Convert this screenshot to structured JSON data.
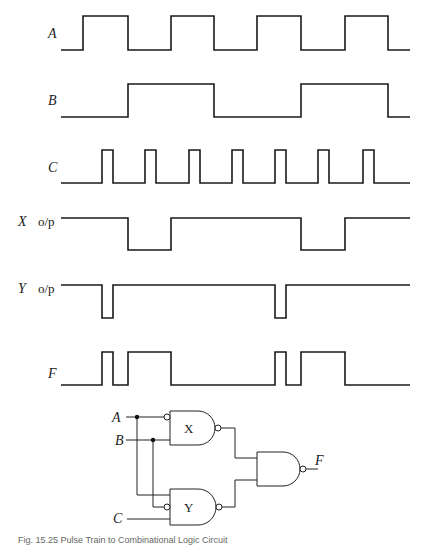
{
  "figure": {
    "caption": "Fig. 15.25  Pulse Train to Combinational Logic Circuit"
  },
  "waveforms": [
    {
      "name": "A",
      "suffix": "",
      "label_y": 33
    },
    {
      "name": "B",
      "suffix": "",
      "label_y": 100
    },
    {
      "name": "C",
      "suffix": "",
      "label_y": 167
    },
    {
      "name": "X",
      "suffix": "o/p",
      "label_y": 221
    },
    {
      "name": "Y",
      "suffix": "o/p",
      "label_y": 288
    },
    {
      "name": "F",
      "suffix": "",
      "label_y": 373
    }
  ],
  "timing": {
    "A": [
      [
        61,
        0
      ],
      [
        83,
        1
      ],
      [
        128,
        0
      ],
      [
        171,
        1
      ],
      [
        214,
        0
      ],
      [
        257,
        1
      ],
      [
        301,
        0
      ],
      [
        345,
        1
      ],
      [
        388,
        0
      ],
      [
        410,
        0
      ]
    ],
    "B": [
      [
        61,
        0
      ],
      [
        128,
        1
      ],
      [
        214,
        0
      ],
      [
        301,
        1
      ],
      [
        388,
        0
      ],
      [
        410,
        0
      ]
    ],
    "C": [
      [
        61,
        0
      ],
      [
        102,
        1
      ],
      [
        113,
        0
      ],
      [
        145,
        1
      ],
      [
        156,
        0
      ],
      [
        189,
        1
      ],
      [
        200,
        0
      ],
      [
        232,
        1
      ],
      [
        243,
        0
      ],
      [
        275,
        1
      ],
      [
        286,
        0
      ],
      [
        318,
        1
      ],
      [
        329,
        0
      ],
      [
        363,
        1
      ],
      [
        374,
        0
      ],
      [
        410,
        0
      ]
    ],
    "X": [
      [
        61,
        1
      ],
      [
        128,
        0
      ],
      [
        171,
        1
      ],
      [
        301,
        0
      ],
      [
        345,
        1
      ],
      [
        410,
        1
      ]
    ],
    "Y": [
      [
        61,
        1
      ],
      [
        102,
        0
      ],
      [
        113,
        1
      ],
      [
        275,
        0
      ],
      [
        286,
        1
      ],
      [
        410,
        1
      ]
    ],
    "F": [
      [
        61,
        0
      ],
      [
        102,
        1
      ],
      [
        113,
        0
      ],
      [
        128,
        1
      ],
      [
        171,
        0
      ],
      [
        275,
        1
      ],
      [
        286,
        0
      ],
      [
        301,
        1
      ],
      [
        345,
        0
      ],
      [
        410,
        0
      ]
    ]
  },
  "circuit": {
    "inputs": [
      "A",
      "B",
      "C"
    ],
    "gates": [
      {
        "id": "X",
        "type": "NAND",
        "inverted_inputs": [
          "A"
        ]
      },
      {
        "id": "Y",
        "type": "NAND",
        "inverted_inputs": [
          "B"
        ]
      },
      {
        "id": "F_gate",
        "type": "NAND"
      }
    ],
    "output": "F"
  },
  "labels": {
    "gate_x": "X",
    "gate_y": "Y",
    "in_a": "A",
    "in_b": "B",
    "in_c": "C",
    "out_f": "F"
  }
}
